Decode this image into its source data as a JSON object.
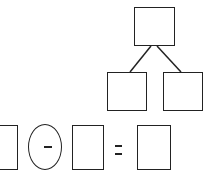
{
  "diagram": {
    "type": "number-bond-and-subtraction",
    "stroke_color": "#222222",
    "background_color": "#ffffff",
    "number_bond": {
      "whole": {
        "value": ""
      },
      "parts": [
        {
          "value": ""
        },
        {
          "value": ""
        }
      ]
    },
    "equation": {
      "operand_1": {
        "value": ""
      },
      "operator": {
        "symbol": "-",
        "shape": "oval"
      },
      "operand_2": {
        "value": ""
      },
      "equals": {
        "symbol": "="
      },
      "result": {
        "value": ""
      }
    }
  }
}
